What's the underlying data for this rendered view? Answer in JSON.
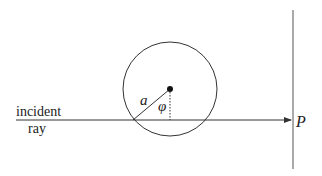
{
  "diagram": {
    "labels": {
      "incident_line1": "incident",
      "incident_line2": "ray",
      "radius": "a",
      "angle": "φ",
      "point": "P"
    },
    "colors": {
      "stroke": "#333333",
      "background": "#ffffff"
    },
    "elements": {
      "circle": {
        "cx": 170,
        "cy": 89,
        "r": 47
      },
      "center_dot": {
        "cx": 170,
        "cy": 89,
        "r": 3
      },
      "incident_ray": {
        "x1": 16,
        "y1": 120,
        "x2": 292,
        "y2": 120,
        "arrow": true
      },
      "radius_line": {
        "x1": 170,
        "y1": 89,
        "x2": 133,
        "y2": 120
      },
      "dotted_line": {
        "x1": 170,
        "y1": 89,
        "x2": 170,
        "y2": 120
      },
      "screen_line": {
        "x1": 293,
        "y1": 10,
        "x2": 293,
        "y2": 169
      }
    }
  }
}
